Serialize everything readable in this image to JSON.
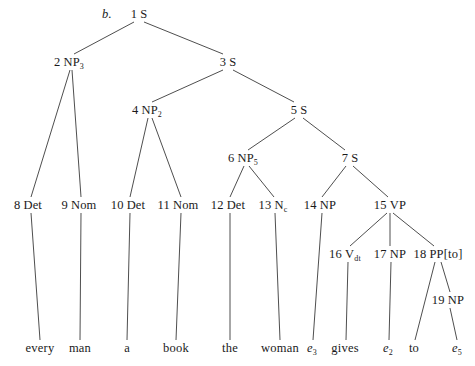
{
  "figure": {
    "item_marker": "b.",
    "width": 475,
    "height": 366,
    "line_color": "#3a3a3a",
    "text_color": "#1a1a1a",
    "background": "#ffffff"
  },
  "nodes": [
    {
      "id": "n1",
      "index": "1",
      "category": "S",
      "subscript": "",
      "x": 139,
      "y": 14
    },
    {
      "id": "n2",
      "index": "2",
      "category": "NP",
      "subscript": "3",
      "x": 69,
      "y": 62
    },
    {
      "id": "n3",
      "index": "3",
      "category": "S",
      "subscript": "",
      "x": 228,
      "y": 62
    },
    {
      "id": "n4",
      "index": "4",
      "category": "NP",
      "subscript": "2",
      "x": 147,
      "y": 110
    },
    {
      "id": "n5",
      "index": "5",
      "category": "S",
      "subscript": "",
      "x": 299,
      "y": 110
    },
    {
      "id": "n6",
      "index": "6",
      "category": "NP",
      "subscript": "5",
      "x": 243,
      "y": 158
    },
    {
      "id": "n7",
      "index": "7",
      "category": "S",
      "subscript": "",
      "x": 350,
      "y": 158
    },
    {
      "id": "n8",
      "index": "8",
      "category": "Det",
      "subscript": "",
      "x": 28,
      "y": 205
    },
    {
      "id": "n9",
      "index": "9",
      "category": "Nom",
      "subscript": "",
      "x": 79,
      "y": 205
    },
    {
      "id": "n10",
      "index": "10",
      "category": "Det",
      "subscript": "",
      "x": 128,
      "y": 205
    },
    {
      "id": "n11",
      "index": "11",
      "category": "Nom",
      "subscript": "",
      "x": 178,
      "y": 205
    },
    {
      "id": "n12",
      "index": "12",
      "category": "Det",
      "subscript": "",
      "x": 228,
      "y": 205
    },
    {
      "id": "n13",
      "index": "13",
      "category": "N",
      "subscript": "c",
      "x": 273,
      "y": 205
    },
    {
      "id": "n14",
      "index": "14",
      "category": "NP",
      "subscript": "",
      "x": 320,
      "y": 205
    },
    {
      "id": "n15",
      "index": "15",
      "category": "VP",
      "subscript": "",
      "x": 390,
      "y": 205
    },
    {
      "id": "n16",
      "index": "16",
      "category": "V",
      "subscript": "dt",
      "x": 345,
      "y": 254
    },
    {
      "id": "n17",
      "index": "17",
      "category": "NP",
      "subscript": "",
      "x": 390,
      "y": 254
    },
    {
      "id": "n18",
      "index": "18",
      "category": "PP[to]",
      "subscript": "",
      "x": 438,
      "y": 254
    },
    {
      "id": "n19",
      "index": "19",
      "category": "NP",
      "subscript": "",
      "x": 448,
      "y": 300
    }
  ],
  "terminals": [
    {
      "id": "t1",
      "text": "every",
      "is_trace": false,
      "trace_sub": "",
      "x": 40,
      "y": 348
    },
    {
      "id": "t2",
      "text": "man",
      "is_trace": false,
      "trace_sub": "",
      "x": 80,
      "y": 348
    },
    {
      "id": "t3",
      "text": "a",
      "is_trace": false,
      "trace_sub": "",
      "x": 127,
      "y": 348
    },
    {
      "id": "t4",
      "text": "book",
      "is_trace": false,
      "trace_sub": "",
      "x": 176,
      "y": 348
    },
    {
      "id": "t5",
      "text": "the",
      "is_trace": false,
      "trace_sub": "",
      "x": 230,
      "y": 348
    },
    {
      "id": "t6",
      "text": "woman",
      "is_trace": false,
      "trace_sub": "",
      "x": 280,
      "y": 348
    },
    {
      "id": "t7",
      "text": "e",
      "is_trace": true,
      "trace_sub": "3",
      "x": 312,
      "y": 348
    },
    {
      "id": "t8",
      "text": "gives",
      "is_trace": false,
      "trace_sub": "",
      "x": 345,
      "y": 348
    },
    {
      "id": "t9",
      "text": "e",
      "is_trace": true,
      "trace_sub": "2",
      "x": 388,
      "y": 348
    },
    {
      "id": "t10",
      "text": "to",
      "is_trace": false,
      "trace_sub": "",
      "x": 414,
      "y": 348
    },
    {
      "id": "t11",
      "text": "e",
      "is_trace": true,
      "trace_sub": "5",
      "x": 457,
      "y": 348
    }
  ],
  "edges": [
    {
      "from": "n1",
      "to": "n2",
      "x1": 134,
      "y1": 22,
      "x2": 74,
      "y2": 54
    },
    {
      "from": "n1",
      "to": "n3",
      "x1": 144,
      "y1": 22,
      "x2": 223,
      "y2": 54
    },
    {
      "from": "n2",
      "to": "n8",
      "x1": 70,
      "y1": 70,
      "x2": 31,
      "y2": 197
    },
    {
      "from": "n2",
      "to": "n9",
      "x1": 72,
      "y1": 70,
      "x2": 81,
      "y2": 197
    },
    {
      "from": "n3",
      "to": "n4",
      "x1": 223,
      "y1": 70,
      "x2": 152,
      "y2": 102
    },
    {
      "from": "n3",
      "to": "n5",
      "x1": 233,
      "y1": 70,
      "x2": 294,
      "y2": 102
    },
    {
      "from": "n4",
      "to": "n10",
      "x1": 148,
      "y1": 118,
      "x2": 130,
      "y2": 197
    },
    {
      "from": "n4",
      "to": "n11",
      "x1": 152,
      "y1": 118,
      "x2": 181,
      "y2": 197
    },
    {
      "from": "n5",
      "to": "n6",
      "x1": 295,
      "y1": 118,
      "x2": 248,
      "y2": 150
    },
    {
      "from": "n5",
      "to": "n7",
      "x1": 303,
      "y1": 118,
      "x2": 345,
      "y2": 150
    },
    {
      "from": "n6",
      "to": "n12",
      "x1": 244,
      "y1": 166,
      "x2": 230,
      "y2": 197
    },
    {
      "from": "n6",
      "to": "n13",
      "x1": 249,
      "y1": 166,
      "x2": 274,
      "y2": 197
    },
    {
      "from": "n7",
      "to": "n14",
      "x1": 346,
      "y1": 166,
      "x2": 322,
      "y2": 197
    },
    {
      "from": "n7",
      "to": "n15",
      "x1": 353,
      "y1": 166,
      "x2": 388,
      "y2": 197
    },
    {
      "from": "n15",
      "to": "n16",
      "x1": 387,
      "y1": 213,
      "x2": 350,
      "y2": 246
    },
    {
      "from": "n15",
      "to": "n17",
      "x1": 390,
      "y1": 213,
      "x2": 390,
      "y2": 246
    },
    {
      "from": "n15",
      "to": "n18",
      "x1": 393,
      "y1": 213,
      "x2": 434,
      "y2": 246
    },
    {
      "from": "n18",
      "to": "t10",
      "x1": 435,
      "y1": 262,
      "x2": 415,
      "y2": 340
    },
    {
      "from": "n18",
      "to": "n19",
      "x1": 441,
      "y1": 262,
      "x2": 450,
      "y2": 292
    },
    {
      "from": "n8",
      "to": "t1",
      "x1": 31,
      "y1": 213,
      "x2": 40,
      "y2": 340
    },
    {
      "from": "n9",
      "to": "t2",
      "x1": 81,
      "y1": 213,
      "x2": 80,
      "y2": 340
    },
    {
      "from": "n10",
      "to": "t3",
      "x1": 130,
      "y1": 213,
      "x2": 127,
      "y2": 340
    },
    {
      "from": "n11",
      "to": "t4",
      "x1": 181,
      "y1": 213,
      "x2": 176,
      "y2": 340
    },
    {
      "from": "n12",
      "to": "t5",
      "x1": 230,
      "y1": 213,
      "x2": 230,
      "y2": 340
    },
    {
      "from": "n13",
      "to": "t6",
      "x1": 275,
      "y1": 213,
      "x2": 280,
      "y2": 340
    },
    {
      "from": "n14",
      "to": "t7",
      "x1": 322,
      "y1": 213,
      "x2": 313,
      "y2": 340
    },
    {
      "from": "n16",
      "to": "t8",
      "x1": 348,
      "y1": 262,
      "x2": 346,
      "y2": 340
    },
    {
      "from": "n17",
      "to": "t9",
      "x1": 391,
      "y1": 262,
      "x2": 389,
      "y2": 340
    },
    {
      "from": "n19",
      "to": "t11",
      "x1": 450,
      "y1": 308,
      "x2": 457,
      "y2": 340
    }
  ],
  "item_marker_pos": {
    "x": 107,
    "y": 14
  }
}
